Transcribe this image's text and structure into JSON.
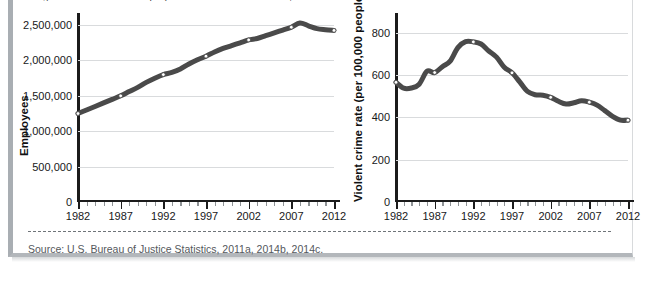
{
  "figure": {
    "caption_fragment": "Figure 1  Correctional employees and violent crime rate, 1982–2012",
    "source": "Source: U.S. Bureau of Justice Statistics, 2011a, 2014b, 2014c.",
    "line_color": "#4a4a4a",
    "grid_color": "#d9dbdd",
    "axis_color": "#1b1b1b",
    "card_border_color": "#a9aeb3"
  },
  "chart_data": [
    {
      "id": "employees",
      "type": "line",
      "title": "",
      "xlabel": "",
      "ylabel": "Employees",
      "x": [
        1982,
        1983,
        1984,
        1985,
        1986,
        1987,
        1988,
        1989,
        1990,
        1991,
        1992,
        1993,
        1994,
        1995,
        1996,
        1997,
        1998,
        1999,
        2000,
        2001,
        2002,
        2003,
        2004,
        2005,
        2006,
        2007,
        2008,
        2009,
        2010,
        2011,
        2012
      ],
      "values": [
        1250000,
        1300000,
        1350000,
        1400000,
        1450000,
        1500000,
        1560000,
        1620000,
        1690000,
        1750000,
        1800000,
        1830000,
        1880000,
        1950000,
        2010000,
        2060000,
        2120000,
        2170000,
        2210000,
        2250000,
        2290000,
        2310000,
        2350000,
        2390000,
        2430000,
        2470000,
        2530000,
        2490000,
        2450000,
        2435000,
        2425000
      ],
      "marker_years": [
        1982,
        1987,
        1992,
        1997,
        2002,
        2007,
        2012
      ],
      "xlim": [
        1982,
        2012
      ],
      "ylim": [
        0,
        2600000
      ],
      "ytick_values": [
        0,
        500000,
        1000000,
        1500000,
        2000000,
        2500000
      ],
      "ytick_labels": [
        "0",
        "500,000",
        "1,000,000",
        "1,500,000",
        "2,000,000",
        "2,500,000"
      ],
      "xtick_values": [
        1982,
        1987,
        1992,
        1997,
        2002,
        2007,
        2012
      ],
      "xtick_labels": [
        "1982",
        "1987",
        "1992",
        "1997",
        "2002",
        "2007",
        "2012"
      ],
      "grid": true,
      "legend": "none"
    },
    {
      "id": "violent-crime-rate",
      "type": "line",
      "title": "",
      "xlabel": "",
      "ylabel": "Violent crime rate (per 100,000 people)",
      "x": [
        1982,
        1983,
        1984,
        1985,
        1986,
        1987,
        1988,
        1989,
        1990,
        1991,
        1992,
        1993,
        1994,
        1995,
        1996,
        1997,
        1998,
        1999,
        2000,
        2001,
        2002,
        2003,
        2004,
        2005,
        2006,
        2007,
        2008,
        2009,
        2010,
        2011,
        2012
      ],
      "values": [
        566,
        538,
        539,
        557,
        618,
        612,
        640,
        666,
        730,
        758,
        757,
        747,
        714,
        685,
        637,
        611,
        568,
        523,
        507,
        505,
        495,
        476,
        463,
        469,
        479,
        472,
        458,
        432,
        405,
        387,
        387
      ],
      "marker_years": [
        1982,
        1987,
        1992,
        1997,
        2002,
        2007,
        2012
      ],
      "xlim": [
        1982,
        2012
      ],
      "ylim": [
        0,
        870
      ],
      "ytick_values": [
        0,
        200,
        400,
        600,
        800
      ],
      "ytick_labels": [
        "0",
        "200",
        "400",
        "600",
        "800"
      ],
      "xtick_values": [
        1982,
        1987,
        1992,
        1997,
        2002,
        2007,
        2012
      ],
      "xtick_labels": [
        "1982",
        "1987",
        "1992",
        "1997",
        "2002",
        "2007",
        "2012"
      ],
      "grid": true,
      "legend": "none"
    }
  ]
}
